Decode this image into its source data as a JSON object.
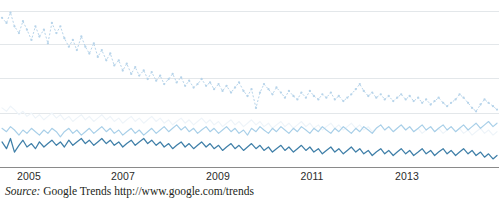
{
  "figure": {
    "title": "",
    "source_label": "Source:",
    "source_text": " Google Trends http://www.google.com/trends"
  },
  "axis": {
    "tick_labels": [
      "2005",
      "2007",
      "2009",
      "2011",
      "2013"
    ],
    "tick_positions_px": [
      29,
      123,
      218,
      312,
      407
    ],
    "axis_line_color": "#8a8a8a",
    "gridline_color": "#e3e7ea",
    "gridlines_y_px": [
      11,
      44,
      78,
      113
    ]
  },
  "colors": {
    "series_dotted": "#b7d4ea",
    "series_pale": "#eef4f9",
    "series_light": "#a8cfe8",
    "series_dark": "#3f7fa8",
    "text": "#231f20",
    "tick_text": "#2b2b2b"
  },
  "chart_data": {
    "type": "line",
    "title": "",
    "xlabel": "",
    "ylabel": "",
    "grid": true,
    "legend": "none",
    "xlim": [
      2004.0,
      2014.0
    ],
    "ylim": [
      0,
      100
    ],
    "x_tick_values": [
      2005,
      2007,
      2009,
      2011,
      2013
    ],
    "x_tick_labels": [
      "2005",
      "2007",
      "2009",
      "2011",
      "2013"
    ],
    "gridline_values": [
      95,
      75,
      55,
      35
    ],
    "x": [
      2004.04,
      2004.13,
      2004.21,
      2004.29,
      2004.38,
      2004.46,
      2004.54,
      2004.63,
      2004.71,
      2004.79,
      2004.88,
      2004.96,
      2005.04,
      2005.13,
      2005.21,
      2005.29,
      2005.38,
      2005.46,
      2005.54,
      2005.63,
      2005.71,
      2005.79,
      2005.88,
      2005.96,
      2006.04,
      2006.13,
      2006.21,
      2006.29,
      2006.38,
      2006.46,
      2006.54,
      2006.63,
      2006.71,
      2006.79,
      2006.88,
      2006.96,
      2007.04,
      2007.13,
      2007.21,
      2007.29,
      2007.38,
      2007.46,
      2007.54,
      2007.63,
      2007.71,
      2007.79,
      2007.88,
      2007.96,
      2008.04,
      2008.13,
      2008.21,
      2008.29,
      2008.38,
      2008.46,
      2008.54,
      2008.63,
      2008.71,
      2008.79,
      2008.88,
      2008.96,
      2009.04,
      2009.13,
      2009.21,
      2009.29,
      2009.38,
      2009.46,
      2009.54,
      2009.63,
      2009.71,
      2009.79,
      2009.88,
      2009.96,
      2010.04,
      2010.13,
      2010.21,
      2010.29,
      2010.38,
      2010.46,
      2010.54,
      2010.63,
      2010.71,
      2010.79,
      2010.88,
      2010.96,
      2011.04,
      2011.13,
      2011.21,
      2011.29,
      2011.38,
      2011.46,
      2011.54,
      2011.63,
      2011.71,
      2011.79,
      2011.88,
      2011.96,
      2012.04,
      2012.13,
      2012.21,
      2012.29,
      2012.38,
      2012.46,
      2012.54,
      2012.63,
      2012.71,
      2012.79,
      2012.88,
      2012.96,
      2013.04,
      2013.13,
      2013.21,
      2013.29,
      2013.38,
      2013.46,
      2013.54,
      2013.63,
      2013.71,
      2013.79,
      2013.88,
      2013.96
    ],
    "series": [
      {
        "name": "series-dotted",
        "style": "dotted",
        "color": "#b7d4ea",
        "values": [
          91,
          88,
          94,
          86,
          82,
          89,
          84,
          78,
          86,
          80,
          84,
          76,
          88,
          82,
          86,
          79,
          74,
          78,
          72,
          80,
          74,
          70,
          76,
          68,
          72,
          66,
          70,
          63,
          66,
          60,
          64,
          58,
          62,
          57,
          60,
          55,
          59,
          54,
          57,
          52,
          55,
          58,
          53,
          56,
          51,
          54,
          50,
          52,
          55,
          51,
          53,
          49,
          52,
          48,
          51,
          47,
          50,
          53,
          48,
          45,
          49,
          38,
          47,
          52,
          49,
          46,
          50,
          47,
          44,
          48,
          45,
          43,
          47,
          44,
          48,
          45,
          43,
          46,
          44,
          47,
          43,
          45,
          42,
          44,
          46,
          49,
          52,
          48,
          45,
          47,
          44,
          46,
          43,
          45,
          42,
          44,
          46,
          43,
          45,
          42,
          44,
          41,
          43,
          40,
          42,
          44,
          41,
          39,
          41,
          43,
          46,
          44,
          41,
          38,
          36,
          40,
          43,
          41,
          39,
          37
        ]
      },
      {
        "name": "series-pale",
        "style": "solid",
        "color": "#eef4f9",
        "values": [
          38,
          36,
          39,
          37,
          34,
          36,
          33,
          35,
          32,
          34,
          31,
          33,
          35,
          32,
          34,
          31,
          33,
          30,
          32,
          34,
          31,
          33,
          30,
          32,
          34,
          31,
          33,
          30,
          32,
          29,
          31,
          33,
          30,
          32,
          29,
          31,
          33,
          30,
          32,
          29,
          31,
          28,
          30,
          32,
          29,
          31,
          28,
          30,
          32,
          29,
          31,
          28,
          30,
          27,
          29,
          31,
          28,
          30,
          27,
          29,
          31,
          28,
          30,
          27,
          29,
          26,
          28,
          30,
          27,
          29,
          26,
          28,
          30,
          27,
          29,
          26,
          28,
          25,
          27,
          29,
          26,
          28,
          25,
          27,
          29,
          26,
          28,
          25,
          27,
          24,
          26,
          28,
          25,
          27,
          24,
          26,
          28,
          25,
          27,
          24,
          26,
          23,
          25,
          27,
          24,
          26,
          23,
          25,
          27,
          24,
          26,
          23,
          25,
          22,
          24,
          26,
          23,
          25,
          22,
          24
        ]
      },
      {
        "name": "series-light",
        "style": "solid",
        "color": "#a8cfe8",
        "values": [
          26,
          24,
          27,
          25,
          22,
          25,
          23,
          26,
          24,
          22,
          25,
          23,
          26,
          24,
          21,
          24,
          26,
          23,
          25,
          22,
          24,
          26,
          23,
          25,
          27,
          24,
          26,
          23,
          25,
          22,
          24,
          26,
          23,
          25,
          22,
          24,
          26,
          23,
          25,
          27,
          24,
          26,
          28,
          25,
          27,
          24,
          26,
          23,
          25,
          27,
          24,
          26,
          23,
          25,
          27,
          24,
          26,
          23,
          25,
          22,
          26,
          24,
          27,
          25,
          23,
          26,
          24,
          27,
          25,
          23,
          26,
          24,
          27,
          25,
          23,
          26,
          24,
          27,
          25,
          23,
          26,
          24,
          27,
          25,
          23,
          26,
          24,
          27,
          25,
          23,
          26,
          28,
          25,
          27,
          24,
          26,
          28,
          25,
          27,
          24,
          26,
          28,
          25,
          27,
          24,
          26,
          28,
          25,
          27,
          24,
          26,
          28,
          25,
          27,
          29,
          26,
          28,
          30,
          27,
          29
        ]
      },
      {
        "name": "series-dark",
        "style": "solid",
        "color": "#3f7fa8",
        "values": [
          18,
          14,
          20,
          12,
          16,
          19,
          15,
          17,
          14,
          18,
          15,
          17,
          19,
          16,
          18,
          15,
          19,
          16,
          18,
          20,
          17,
          19,
          16,
          18,
          20,
          17,
          19,
          16,
          18,
          15,
          17,
          19,
          16,
          18,
          20,
          17,
          19,
          16,
          18,
          15,
          17,
          14,
          16,
          18,
          15,
          17,
          14,
          16,
          18,
          15,
          17,
          14,
          16,
          13,
          15,
          17,
          14,
          16,
          13,
          15,
          17,
          14,
          16,
          13,
          15,
          12,
          14,
          16,
          13,
          15,
          12,
          14,
          16,
          13,
          15,
          12,
          14,
          11,
          13,
          15,
          12,
          14,
          11,
          13,
          15,
          12,
          14,
          11,
          13,
          10,
          12,
          14,
          11,
          13,
          10,
          12,
          14,
          11,
          13,
          10,
          12,
          14,
          11,
          13,
          10,
          12,
          14,
          11,
          13,
          10,
          12,
          14,
          11,
          13,
          10,
          12,
          9,
          11,
          8,
          10
        ]
      }
    ]
  }
}
